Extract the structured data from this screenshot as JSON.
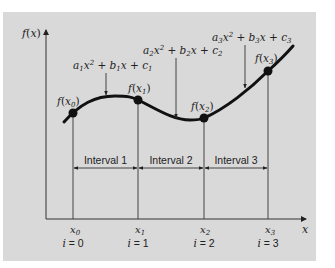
{
  "figure": {
    "y_axis_label": "f(x)",
    "x_axis_label": "x",
    "equations": [
      {
        "id": "eq1",
        "a": "a",
        "sub": "1",
        "text_pre": "a",
        "label": "a1x2 + b1x + c1"
      },
      {
        "id": "eq2",
        "label": "a2x2 + b2x + c2"
      },
      {
        "id": "eq3",
        "label": "a3x2 + b3x + c3"
      }
    ],
    "points": [
      {
        "label": "f(x0)",
        "x_label": "x0",
        "index_label": "i = 0"
      },
      {
        "label": "f(x1)",
        "x_label": "x1",
        "index_label": "i = 1"
      },
      {
        "label": "f(x2)",
        "x_label": "x2",
        "index_label": "i = 2"
      },
      {
        "label": "f(x3)",
        "x_label": "x3",
        "index_label": "i = 3"
      }
    ],
    "intervals": [
      {
        "label": "Interval 1"
      },
      {
        "label": "Interval 2"
      },
      {
        "label": "Interval 3"
      }
    ],
    "colors": {
      "background": "#d9d9d9",
      "curve": "#111111",
      "lines": "#333333"
    }
  }
}
